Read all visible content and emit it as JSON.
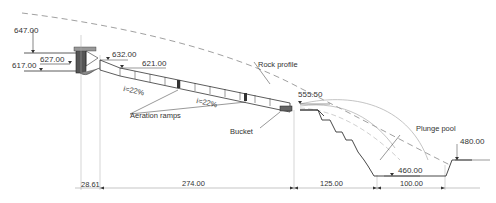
{
  "diagram": {
    "type": "spillway-longitudinal-section",
    "elevations": {
      "crest_top": "647.00",
      "reservoir": "627.00",
      "sill": "617.00",
      "chute_start": "632.00",
      "chute_upper": "621.00",
      "bucket": "555.50",
      "pool_bottom": "460.00",
      "downstream": "480.00"
    },
    "labels": {
      "rock_profile": "Rock profile",
      "slope_upper": "i=22%",
      "slope_lower": "i=22%",
      "aeration_ramps": "Aeration ramps",
      "bucket": "Bucket",
      "plunge_pool": "Plunge pool"
    },
    "dimensions": {
      "d1": "28.61",
      "d2": "274.00",
      "d3": "125.00",
      "d4": "100.00"
    },
    "colors": {
      "line": "#333333",
      "dashed": "#777777",
      "thin": "#999999"
    }
  }
}
